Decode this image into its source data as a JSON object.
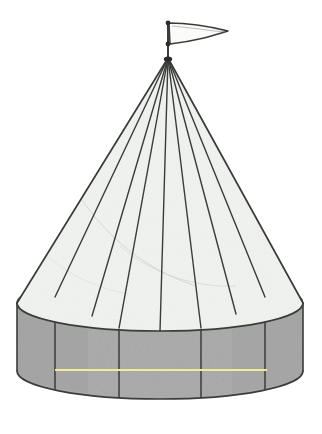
{
  "figure": {
    "name": "circus-tent-solid",
    "caption": "Cone on top of a cylinder with a pennant flag at the apex",
    "background_color": "#ffffff",
    "canvas": {
      "width": 322,
      "height": 434
    }
  },
  "colors": {
    "cylinder_fill": "#a8a8a8",
    "cone_fill": "#f1f3ef",
    "outline": "#3a3c3a",
    "outline_soft": "#4a4c4a",
    "hidden_edge": "#4a4c4a",
    "highlight_line": "#eeeb9a",
    "flag_fill": "#fbfbf9",
    "flag_stroke": "#3a3c3a",
    "marker_fill": "#2b2d2b",
    "smudge": "#c9cdd2"
  },
  "geometry": {
    "apex": {
      "x": 168,
      "y": 58
    },
    "base_ellipse": {
      "cx": 160,
      "cy": 303,
      "rx": 143,
      "ry": 28,
      "label": "cone-base-and-cylinder-top-rim"
    },
    "bottom_ellipse": {
      "cx": 160,
      "cy": 371,
      "rx": 143,
      "ry": 28,
      "label": "cylinder-bottom-rim"
    },
    "cylinder": {
      "left_x": 17,
      "right_x": 303,
      "top_cy": 303,
      "bottom_cy": 371,
      "height": 68
    },
    "slant_lines_count": 8,
    "slant_line_base_angles_deg": [
      182,
      202,
      226,
      254,
      286,
      314,
      338,
      358
    ],
    "vertical_seam_x": [
      55,
      119,
      201,
      265
    ],
    "highlight_line": {
      "x1": 55,
      "x2": 267,
      "y": 370
    },
    "flag": {
      "pole_x": 168,
      "pole_top_y": 22,
      "pole_bottom_y": 58,
      "pennant_tip_x": 228,
      "pennant_top_y": 24,
      "pennant_bottom_y": 44,
      "markers": [
        {
          "x": 168,
          "y": 23
        },
        {
          "x": 168,
          "y": 44
        }
      ]
    }
  },
  "labels": {
    "apex": "apex",
    "flag": "pennant-flag",
    "flagpole": "flagpole",
    "cone_surface": "cone-lateral-surface",
    "cylinder_surface": "cylinder-lateral-surface",
    "hidden_rim": "hidden-back-rim-dashed",
    "visible_rim": "visible-front-rim",
    "bottom_rim": "cylinder-bottom-rim",
    "highlight": "yellow-highlight-line",
    "seams": "tent-seam-lines"
  }
}
